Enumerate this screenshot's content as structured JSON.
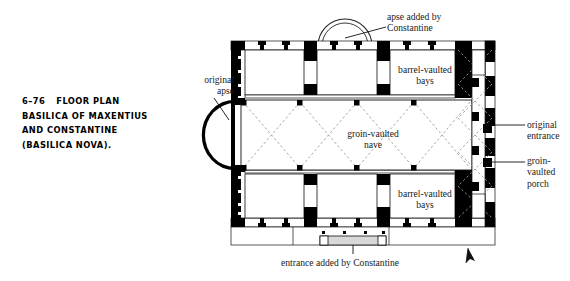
{
  "figure": {
    "number": "6–76",
    "caption_lines": [
      "FLOOR PLAN",
      "BASILICA OF MAXENTIUS",
      "AND CONSTANTINE",
      "(BASILICA NOVA)."
    ],
    "caption_full": "6–76  FLOOR PLAN BASILICA OF MAXENTIUS AND CONSTANTINE (BASILICA NOVA)."
  },
  "annotations": {
    "apse_added_by_constantine": "apse added by\nConstantine",
    "original_apse": "original\napse",
    "barrel_vaulted_bays_top": "barrel-vaulted\nbays",
    "barrel_vaulted_bays_bottom": "barrel-vaulted\nbays",
    "groin_vaulted_nave": "groin-vaulted\nnave",
    "original_entrance": "original\nentrance",
    "groin_vaulted_porch": "groin-\nvaulted\nporch",
    "entrance_added_by_constantine": "entrance added by Constantine"
  },
  "colors": {
    "masonry_fill": "#000000",
    "wall_outline": "#111111",
    "paper": "#ffffff",
    "vault_dash": "#9a9a9a",
    "room_fill": "#ffffff",
    "leader_line": "#111111",
    "text": "#1a1a1a"
  },
  "plan": {
    "title": "Basilica of Maxentius and Constantine floor plan",
    "orientation_marker": "north-arrow",
    "elements": [
      {
        "name": "north-wall",
        "type": "masonry-wall"
      },
      {
        "name": "south-wall",
        "type": "masonry-wall"
      },
      {
        "name": "west-wall",
        "type": "masonry-wall"
      },
      {
        "name": "east-wall",
        "type": "masonry-wall"
      },
      {
        "name": "original-apse",
        "type": "semicircular-apse",
        "side": "west"
      },
      {
        "name": "constantinian-apse",
        "type": "semicircular-apse",
        "side": "north"
      },
      {
        "name": "constantinian-entrance",
        "type": "entrance-porch",
        "side": "south"
      },
      {
        "name": "groin-vaulted-nave",
        "type": "vaulted-hall",
        "vault": "groin"
      },
      {
        "name": "north-barrel-vaulted-bays",
        "type": "bay-row",
        "vault": "barrel",
        "count": 3
      },
      {
        "name": "south-barrel-vaulted-bays",
        "type": "bay-row",
        "vault": "barrel",
        "count": 3
      },
      {
        "name": "groin-vaulted-porch",
        "type": "porch",
        "vault": "groin",
        "side": "east"
      },
      {
        "name": "original-entrance",
        "type": "entrance",
        "side": "east"
      },
      {
        "name": "nave-piers",
        "type": "pier-group",
        "count": 8
      }
    ]
  }
}
